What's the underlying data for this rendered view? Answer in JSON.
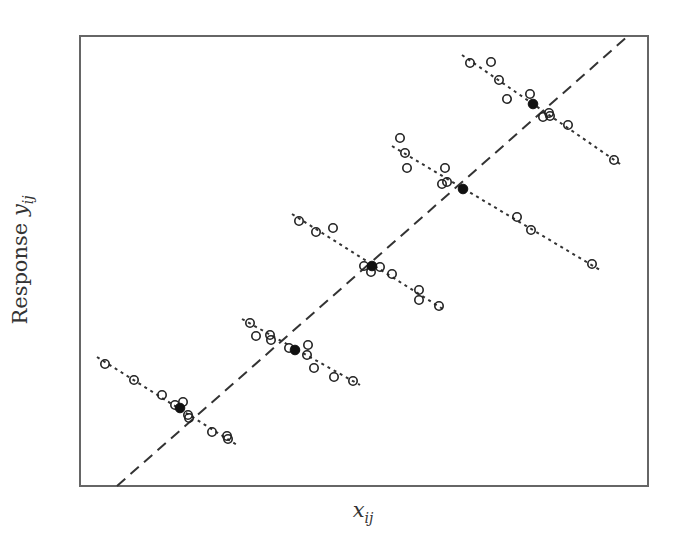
{
  "chart_data": {
    "type": "scatter",
    "title": "",
    "xlabel": "x_ij",
    "ylabel": "Response y_ij",
    "xlabel_parts": {
      "base": "x",
      "sub": "ij"
    },
    "ylabel_parts": {
      "prefix": "Response ",
      "base": "y",
      "sub": "ij"
    },
    "grid": false,
    "legend": null,
    "ticks": "none",
    "frame": {
      "left": 80,
      "top": 36,
      "right": 648,
      "bottom": 486
    },
    "between_cluster_line": {
      "style": "dashed",
      "x1": 117,
      "y1": 486,
      "x2": 628,
      "y2": 36
    },
    "clusters": [
      {
        "name": "cluster 1",
        "within_line": {
          "style": "dotted",
          "x1": 97,
          "y1": 357,
          "x2": 237,
          "y2": 445
        },
        "mean": [
          180,
          408
        ],
        "points": [
          [
            105,
            364
          ],
          [
            134,
            380
          ],
          [
            162,
            395
          ],
          [
            175,
            405
          ],
          [
            183,
            402
          ],
          [
            188,
            415
          ],
          [
            189,
            418
          ],
          [
            212,
            432
          ],
          [
            227,
            436
          ],
          [
            228,
            439
          ]
        ]
      },
      {
        "name": "cluster 2",
        "within_line": {
          "style": "dotted",
          "x1": 242,
          "y1": 319,
          "x2": 360,
          "y2": 385
        },
        "mean": [
          295,
          350
        ],
        "points": [
          [
            250,
            323
          ],
          [
            256,
            336
          ],
          [
            270,
            335
          ],
          [
            271,
            340
          ],
          [
            289,
            348
          ],
          [
            308,
            345
          ],
          [
            307,
            355
          ],
          [
            314,
            368
          ],
          [
            334,
            377
          ],
          [
            353,
            381
          ]
        ]
      },
      {
        "name": "cluster 3",
        "within_line": {
          "style": "dotted",
          "x1": 292,
          "y1": 214,
          "x2": 446,
          "y2": 311
        },
        "mean": [
          372,
          266
        ],
        "points": [
          [
            299,
            221
          ],
          [
            316,
            232
          ],
          [
            333,
            228
          ],
          [
            364,
            266
          ],
          [
            371,
            272
          ],
          [
            380,
            267
          ],
          [
            392,
            274
          ],
          [
            419,
            290
          ],
          [
            419,
            300
          ],
          [
            439,
            306
          ]
        ]
      },
      {
        "name": "cluster 4",
        "within_line": {
          "style": "dotted",
          "x1": 392,
          "y1": 146,
          "x2": 600,
          "y2": 270
        },
        "mean": [
          463,
          189
        ],
        "points": [
          [
            400,
            138
          ],
          [
            405,
            153
          ],
          [
            407,
            168
          ],
          [
            445,
            168
          ],
          [
            442,
            184
          ],
          [
            447,
            182
          ],
          [
            517,
            217
          ],
          [
            531,
            230
          ],
          [
            592,
            264
          ]
        ]
      },
      {
        "name": "cluster 5",
        "within_line": {
          "style": "dotted",
          "x1": 462,
          "y1": 55,
          "x2": 623,
          "y2": 166
        },
        "mean": [
          533,
          104
        ],
        "points": [
          [
            470,
            63
          ],
          [
            491,
            62
          ],
          [
            499,
            80
          ],
          [
            507,
            99
          ],
          [
            530,
            94
          ],
          [
            543,
            117
          ],
          [
            549,
            113
          ],
          [
            550,
            116
          ],
          [
            568,
            125
          ],
          [
            614,
            160
          ]
        ]
      }
    ],
    "markers": {
      "observation": "open-circle",
      "cluster_mean": "filled-circle"
    },
    "colors": {
      "frame": "#666666",
      "lines": "#333333",
      "markers": "#222222"
    }
  }
}
